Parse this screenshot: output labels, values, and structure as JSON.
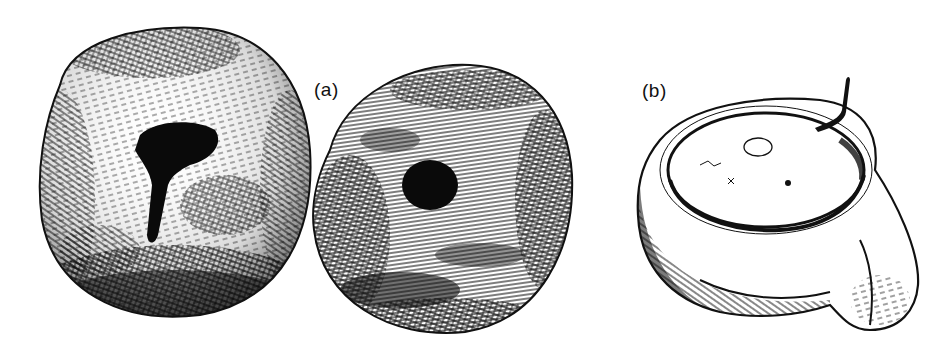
{
  "figure": {
    "panels": [
      {
        "id": "a",
        "label": "(a)",
        "description": "Two rounded stones drawn in pen-and-ink hatching"
      },
      {
        "id": "b",
        "label": "(b)",
        "description": "Shallow stone lamp/bowl with spout and wick, pen-and-ink"
      }
    ],
    "colors": {
      "ink": "#111111",
      "paper": "#ffffff"
    }
  }
}
